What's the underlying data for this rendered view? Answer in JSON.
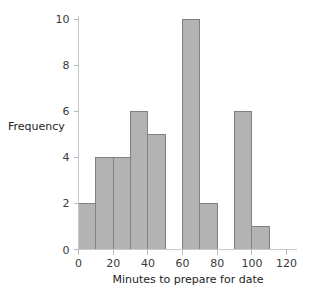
{
  "chart_data": {
    "type": "bar",
    "title": "",
    "subtitle": "",
    "xlabel": "Minutes to prepare for date",
    "ylabel": "Frequency",
    "bin_width": 10,
    "bin_edges": [
      0,
      10,
      20,
      30,
      40,
      50,
      60,
      70,
      80,
      90,
      100,
      110
    ],
    "categories": [
      "0-10",
      "10-20",
      "20-30",
      "30-40",
      "40-50",
      "50-60",
      "60-70",
      "70-80",
      "80-90",
      "90-100",
      "100-110"
    ],
    "values": [
      2,
      4,
      4,
      6,
      5,
      0,
      10,
      2,
      0,
      6,
      1
    ],
    "bars": [
      {
        "x0": 0,
        "x1": 10,
        "value": 2
      },
      {
        "x0": 10,
        "x1": 20,
        "value": 4
      },
      {
        "x0": 20,
        "x1": 30,
        "value": 4
      },
      {
        "x0": 30,
        "x1": 40,
        "value": 6
      },
      {
        "x0": 40,
        "x1": 50,
        "value": 5
      },
      {
        "x0": 50,
        "x1": 60,
        "value": 0
      },
      {
        "x0": 60,
        "x1": 70,
        "value": 10
      },
      {
        "x0": 70,
        "x1": 80,
        "value": 2
      },
      {
        "x0": 80,
        "x1": 90,
        "value": 0
      },
      {
        "x0": 90,
        "x1": 100,
        "value": 6
      },
      {
        "x0": 100,
        "x1": 110,
        "value": 1
      }
    ],
    "xlim": [
      0,
      126
    ],
    "ylim": [
      0,
      10.4
    ],
    "xticks": [
      0,
      20,
      40,
      60,
      80,
      100,
      120
    ],
    "xtick_labels": [
      "0",
      "20",
      "40",
      "60",
      "80",
      "100",
      "120"
    ],
    "yticks": [
      0,
      2,
      4,
      6,
      8,
      10
    ],
    "ytick_labels": [
      "0",
      "2",
      "4",
      "6",
      "8",
      "10"
    ],
    "grid": false,
    "legend": false,
    "legend_position": "none",
    "colors": {
      "bar_fill": "#b3b3b3",
      "bar_stroke": "#808080",
      "axis_line": "#c9c9c9",
      "tick_mark": "#b9b9b9",
      "tick_label": "#3a3a3a",
      "axis_title": "#1d1d1d",
      "background": "#ffffff"
    }
  }
}
